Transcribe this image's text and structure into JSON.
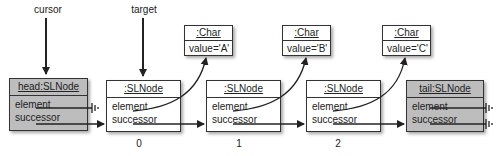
{
  "labels": {
    "cursor": "cursor",
    "target": "target"
  },
  "nodes": [
    {
      "title": "head:SLNode",
      "fields": [
        "element",
        "successor"
      ],
      "shaded": true
    },
    {
      "title": ":SLNode",
      "fields": [
        "element",
        "successor"
      ],
      "shaded": false,
      "index": "0"
    },
    {
      "title": ":SLNode",
      "fields": [
        "element",
        "successor"
      ],
      "shaded": false,
      "index": "1"
    },
    {
      "title": ":SLNode",
      "fields": [
        "element",
        "successor"
      ],
      "shaded": false,
      "index": "2"
    },
    {
      "title": "tail:SLNode",
      "fields": [
        "element",
        "successor"
      ],
      "shaded": true
    }
  ],
  "chars": [
    {
      "title": ":Char",
      "value": "value='A'"
    },
    {
      "title": ":Char",
      "value": "value='B'"
    },
    {
      "title": ":Char",
      "value": "value='C'"
    }
  ],
  "colors": {
    "shaded_node": "#bdbdbd",
    "line": "#222222"
  }
}
